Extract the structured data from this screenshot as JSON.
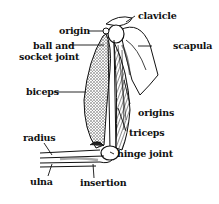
{
  "diagram": {
    "type": "anatomy-labeled-illustration",
    "labels": {
      "origin": "origin",
      "ball_socket_1": "ball and",
      "ball_socket_2": "socket joint",
      "biceps": "biceps",
      "radius": "radius",
      "ulna": "ulna",
      "clavicle": "clavicle",
      "scapula": "scapula",
      "origins": "origins",
      "triceps": "triceps",
      "hinge_joint": "hinge joint",
      "insertion": "insertion"
    },
    "colors": {
      "ink": "#111111",
      "background": "#ffffff",
      "stipple": "#555555"
    }
  }
}
